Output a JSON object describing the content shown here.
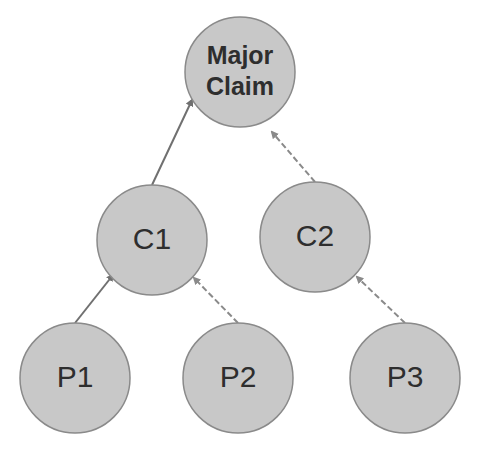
{
  "diagram": {
    "nodes": [
      {
        "id": "major-claim",
        "lines": [
          "Major",
          "Claim"
        ],
        "bold": true
      },
      {
        "id": "c1",
        "lines": [
          "C1"
        ],
        "bold": false
      },
      {
        "id": "c2",
        "lines": [
          "C2"
        ],
        "bold": false
      },
      {
        "id": "p1",
        "lines": [
          "P1"
        ],
        "bold": false
      },
      {
        "id": "p2",
        "lines": [
          "P2"
        ],
        "bold": false
      },
      {
        "id": "p3",
        "lines": [
          "P3"
        ],
        "bold": false
      }
    ],
    "edges": [
      {
        "from": "c1",
        "to": "major-claim",
        "style": "solid"
      },
      {
        "from": "c2",
        "to": "major-claim",
        "style": "dashed"
      },
      {
        "from": "p1",
        "to": "c1",
        "style": "solid"
      },
      {
        "from": "p2",
        "to": "c1",
        "style": "dashed"
      },
      {
        "from": "p3",
        "to": "c2",
        "style": "dashed"
      }
    ],
    "colors": {
      "node_fill": "#c8c8c8",
      "node_stroke": "#8a8a8a",
      "text": "#2e2e2e",
      "edge": "#707070"
    }
  }
}
